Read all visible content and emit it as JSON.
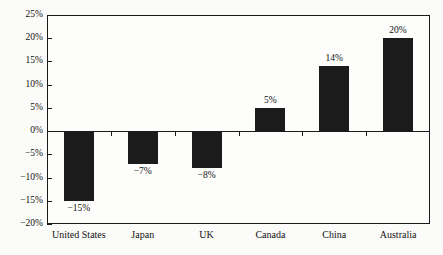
{
  "chart_data": {
    "type": "bar",
    "title": "",
    "subtitle": "",
    "xlabel": "",
    "ylabel": "",
    "categories": [
      "United States",
      "Japan",
      "UK",
      "Canada",
      "China",
      "Australia"
    ],
    "values": [
      -15,
      -7,
      -8,
      5,
      14,
      20
    ],
    "value_labels": [
      "−15%",
      "−7%",
      "−8%",
      "5%",
      "14%",
      "20%"
    ],
    "ylim": [
      -20,
      25
    ],
    "ytick_values": [
      25,
      20,
      15,
      10,
      5,
      0,
      -5,
      -10,
      -15,
      -20
    ],
    "ytick_labels": [
      "25%",
      "20%",
      "15%",
      "10%",
      "5%",
      "0%",
      "−5%",
      "−10%",
      "−15%",
      "−20%"
    ],
    "grid": false,
    "legend": null,
    "legend_position": "none",
    "bar_color": "#1b1b1b",
    "axis_color": "#1a1a1a",
    "background_color": "#fbfbf9",
    "zero_baseline": 0
  }
}
